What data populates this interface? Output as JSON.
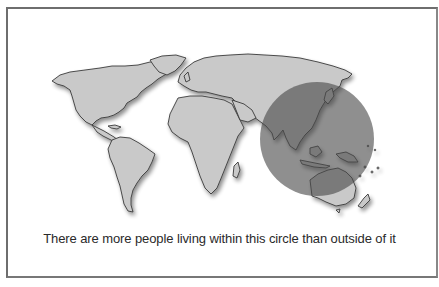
{
  "figure": {
    "caption": "There are more people living within this circle than outside of it",
    "circle": {
      "label": "population-circle",
      "region": "South & East Asia",
      "fill": "#4a4a4a",
      "opacity": 0.62
    },
    "colors": {
      "land": "#c9c9c9",
      "coast": "#3a3a3a",
      "border": "#6e6e6e",
      "background": "#ffffff",
      "shadow": "#9a9a9a"
    }
  }
}
